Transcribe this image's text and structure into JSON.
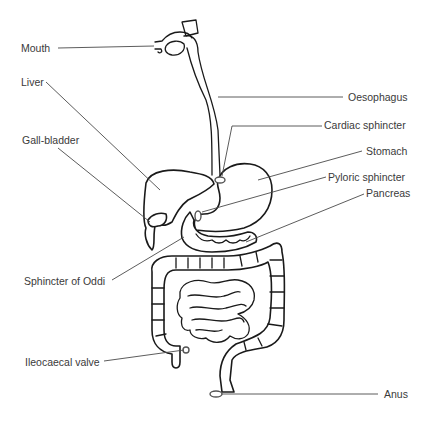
{
  "diagram": {
    "type": "anatomical-labeled-diagram",
    "colors": {
      "line": "#1a1a1a",
      "leader": "#4a4a4a",
      "text": "#3a3a3a",
      "background": "#ffffff"
    },
    "labels_left": [
      {
        "id": "mouth",
        "text": "Mouth"
      },
      {
        "id": "liver",
        "text": "Liver"
      },
      {
        "id": "gall_bladder",
        "text": "Gall-bladder"
      },
      {
        "id": "sphincter_of_oddi",
        "text": "Sphincter of Oddi"
      },
      {
        "id": "ileocaecal_valve",
        "text": "Ileocaecal valve"
      }
    ],
    "labels_right": [
      {
        "id": "oesophagus",
        "text": "Oesophagus"
      },
      {
        "id": "cardiac_sphincter",
        "text": "Cardiac sphincter"
      },
      {
        "id": "stomach",
        "text": "Stomach"
      },
      {
        "id": "pyloric_sphincter",
        "text": "Pyloric sphincter"
      },
      {
        "id": "pancreas",
        "text": "Pancreas"
      },
      {
        "id": "anus",
        "text": "Anus"
      }
    ]
  }
}
